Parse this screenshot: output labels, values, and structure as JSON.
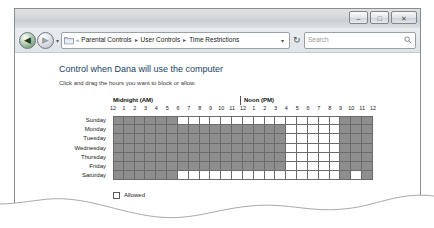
{
  "window": {
    "controls": [
      {
        "name": "minimize",
        "glyph": "–"
      },
      {
        "name": "maximize",
        "glyph": "□"
      },
      {
        "name": "close",
        "glyph": "✕"
      }
    ]
  },
  "addressbar": {
    "back_glyph": "◀",
    "forward_glyph": "▶",
    "history_chevron": "▾",
    "breadcrumb_lead": "«",
    "breadcrumbs": [
      "Parental Controls",
      "User Controls",
      "Time Restrictions"
    ],
    "breadcrumb_arrow": "▸",
    "dropdown_glyph": "▾",
    "refresh_glyph": "↻"
  },
  "search": {
    "placeholder": "Search"
  },
  "page": {
    "heading": "Control when Dana will use the computer",
    "subheading": "Click and drag the hours you want to block or allow."
  },
  "schedule": {
    "midnight_label": "Midnight (AM)",
    "noon_label": "Noon (PM)",
    "hours": [
      "12",
      "1",
      "2",
      "3",
      "4",
      "5",
      "6",
      "7",
      "8",
      "9",
      "10",
      "11",
      "12",
      "1",
      "2",
      "3",
      "4",
      "5",
      "6",
      "7",
      "8",
      "9",
      "10",
      "11",
      "12"
    ],
    "days": [
      "Sunday",
      "Monday",
      "Tuesday",
      "Wednesday",
      "Thursday",
      "Friday",
      "Saturday"
    ],
    "blocked_color": "#8e8e8e",
    "allowed_color": "#ffffff",
    "cells": [
      [
        1,
        1,
        1,
        1,
        1,
        1,
        0,
        0,
        0,
        0,
        0,
        0,
        0,
        0,
        0,
        0,
        0,
        0,
        0,
        0,
        0,
        1,
        1,
        1
      ],
      [
        1,
        1,
        1,
        1,
        1,
        1,
        1,
        1,
        1,
        1,
        1,
        1,
        1,
        1,
        1,
        1,
        0,
        0,
        0,
        0,
        0,
        1,
        1,
        1
      ],
      [
        1,
        1,
        1,
        1,
        1,
        1,
        1,
        1,
        1,
        1,
        1,
        1,
        1,
        1,
        1,
        1,
        0,
        0,
        0,
        0,
        0,
        1,
        1,
        1
      ],
      [
        1,
        1,
        1,
        1,
        1,
        1,
        1,
        1,
        1,
        1,
        1,
        1,
        1,
        1,
        1,
        1,
        0,
        0,
        0,
        0,
        0,
        1,
        1,
        1
      ],
      [
        1,
        1,
        1,
        1,
        1,
        1,
        1,
        1,
        1,
        1,
        1,
        1,
        1,
        1,
        1,
        1,
        0,
        0,
        0,
        0,
        0,
        1,
        1,
        1
      ],
      [
        1,
        1,
        1,
        1,
        1,
        1,
        1,
        1,
        1,
        1,
        1,
        1,
        1,
        1,
        1,
        1,
        0,
        0,
        0,
        0,
        0,
        1,
        1,
        1
      ],
      [
        1,
        1,
        1,
        1,
        1,
        1,
        0,
        0,
        0,
        0,
        0,
        0,
        0,
        0,
        0,
        0,
        0,
        0,
        0,
        0,
        0,
        1,
        0,
        1
      ]
    ]
  },
  "legend": {
    "allowed_label": "Allowed",
    "blocked_label": "Blocked"
  }
}
